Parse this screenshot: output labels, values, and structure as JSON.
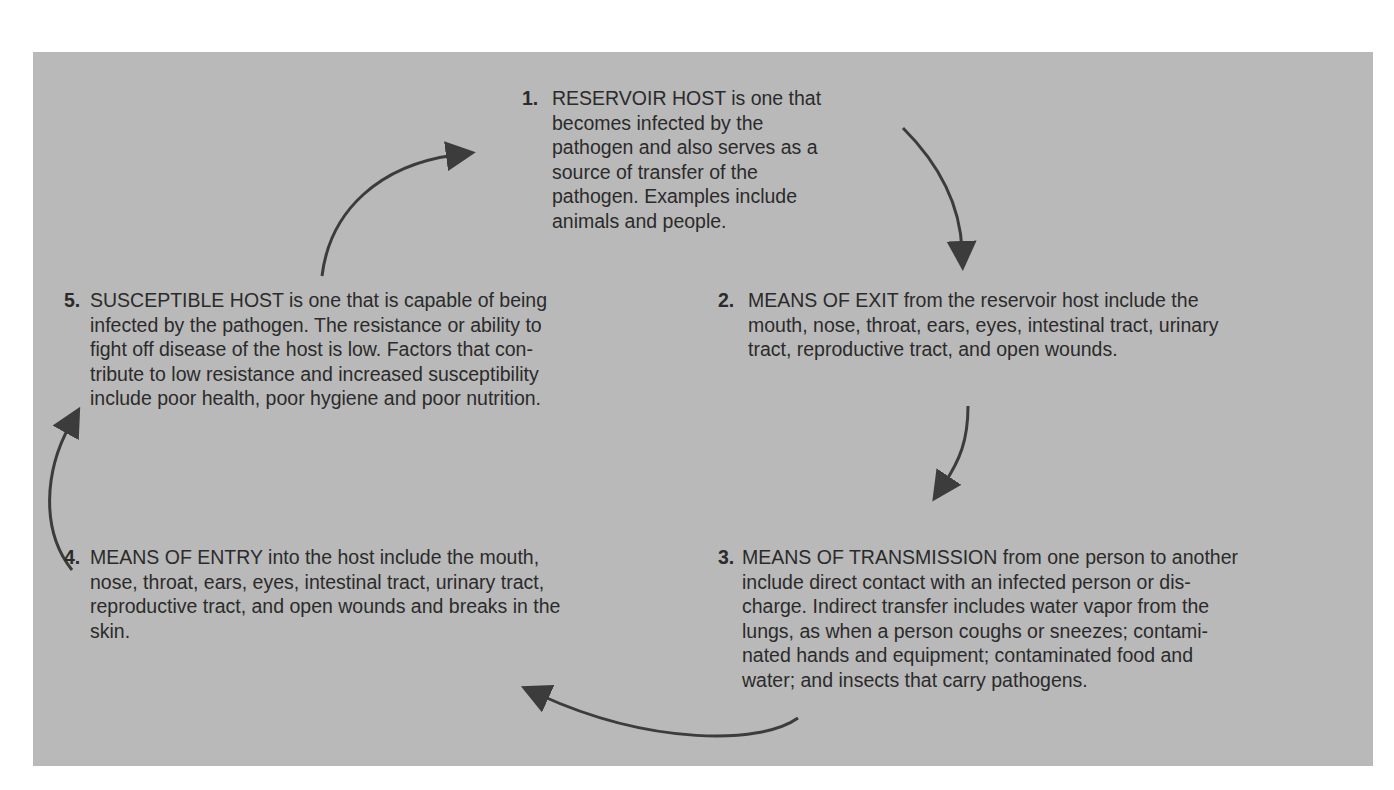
{
  "diagram": {
    "background_color": "#b9b9b9",
    "arrow_color": "#3c3c3c",
    "steps": [
      {
        "number": "1.",
        "heading": "RESERVOIR HOST",
        "lines": [
          "RESERVOIR HOST is one that",
          "becomes infected by the",
          "pathogen and also serves as a",
          "source of transfer of the",
          "pathogen. Examples include",
          "animals and people."
        ]
      },
      {
        "number": "2.",
        "heading": "MEANS OF EXIT",
        "lines": [
          "MEANS OF EXIT from the reservoir host include the",
          "mouth, nose, throat, ears, eyes, intestinal tract, urinary",
          "tract, reproductive tract, and open wounds."
        ]
      },
      {
        "number": "3.",
        "heading": "MEANS OF TRANSMISSION",
        "lines": [
          "MEANS OF TRANSMISSION from one person to another",
          "include direct contact with an infected person or dis-",
          "charge. Indirect transfer includes water vapor from the",
          "lungs, as when a person coughs or sneezes; contami-",
          "nated hands and equipment; contaminated food and",
          "water; and insects that carry pathogens."
        ]
      },
      {
        "number": "4.",
        "heading": "MEANS OF ENTRY",
        "lines": [
          "MEANS OF ENTRY into the host include the mouth,",
          "nose, throat, ears, eyes, intestinal tract, urinary tract,",
          "reproductive tract, and open wounds and breaks in the",
          "skin."
        ]
      },
      {
        "number": "5.",
        "heading": "SUSCEPTIBLE HOST",
        "lines": [
          "SUSCEPTIBLE HOST is one that is capable of being",
          "infected by the pathogen. The resistance or ability to",
          "fight off disease of the host is low. Factors that con-",
          "tribute to low resistance and increased susceptibility",
          "include poor health, poor hygiene and poor nutrition."
        ]
      }
    ],
    "arrows": [
      {
        "from": "1",
        "to": "2"
      },
      {
        "from": "2",
        "to": "3"
      },
      {
        "from": "3",
        "to": "4"
      },
      {
        "from": "4",
        "to": "5"
      },
      {
        "from": "5",
        "to": "1"
      }
    ]
  }
}
